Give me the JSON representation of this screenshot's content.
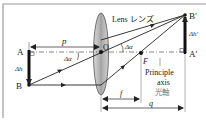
{
  "diagram": {
    "type": "thin-lens-ray-diagram",
    "lens": {
      "label": "Lens レンズ"
    },
    "object": {
      "top_label": "A",
      "bottom_label": "B",
      "height_label": "Δh"
    },
    "image": {
      "top_label": "B′",
      "bottom_label": "A′",
      "height_label": "Δh′"
    },
    "center_label": "O",
    "focal_point_label": "F",
    "angle_label_left": "Δα",
    "angle_label_right": "Δα",
    "distances": {
      "object_distance": "p",
      "focal_length": "f",
      "image_distance": "q"
    },
    "axis_label": {
      "line1": "Principle",
      "line2": "axis",
      "line3": "光軸"
    },
    "colors": {
      "lines": "#222222",
      "lens_fill": "#b8b8b8",
      "lens_stroke": "#555555",
      "frame": "#999999",
      "axis": "#555555"
    }
  }
}
